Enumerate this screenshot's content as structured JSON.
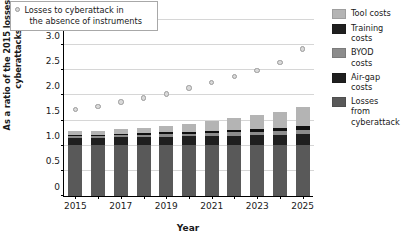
{
  "chart_data": {
    "type": "bar",
    "title": "",
    "xlabel": "Year",
    "ylabel": "As a ratio of the 2015 losses to cyberattacks",
    "ylim": [
      0,
      3.5
    ],
    "ytick_values": [
      0,
      0.5,
      1.0,
      1.5,
      2.0,
      2.5,
      3.0,
      3.5
    ],
    "ytick_labels": [
      "0",
      "0.5",
      "1.0",
      "1.5",
      "2.0",
      "2.5",
      "3.0",
      "3.5"
    ],
    "grid": true,
    "legend_position": "right",
    "categories": [
      "2015",
      "2016",
      "2017",
      "2018",
      "2019",
      "2020",
      "2021",
      "2022",
      "2023",
      "2024",
      "2025"
    ],
    "xtick_labels": [
      "2015",
      "",
      "2017",
      "",
      "2019",
      "",
      "2021",
      "",
      "2023",
      "",
      "2025"
    ],
    "stacked": true,
    "series": [
      {
        "name": "Losses from cyberattack",
        "color": "#595959",
        "values": [
          1.02,
          1.02,
          1.02,
          1.02,
          1.02,
          1.02,
          1.02,
          1.02,
          1.02,
          1.02,
          1.02
        ]
      },
      {
        "name": "Air-gap costs",
        "color": "#1f1f1f",
        "values": [
          0.14,
          0.14,
          0.15,
          0.15,
          0.16,
          0.17,
          0.17,
          0.18,
          0.19,
          0.2,
          0.21
        ]
      },
      {
        "name": "BYOD costs",
        "color": "#8c8c8c",
        "values": [
          0.03,
          0.03,
          0.04,
          0.04,
          0.05,
          0.05,
          0.06,
          0.07,
          0.07,
          0.08,
          0.09
        ]
      },
      {
        "name": "Training costs",
        "color": "#111111",
        "values": [
          0.03,
          0.03,
          0.03,
          0.04,
          0.04,
          0.04,
          0.05,
          0.05,
          0.06,
          0.06,
          0.07
        ]
      },
      {
        "name": "Tool costs",
        "color": "#b4b4b4",
        "values": [
          0.07,
          0.08,
          0.09,
          0.11,
          0.13,
          0.16,
          0.19,
          0.23,
          0.27,
          0.32,
          0.38
        ]
      }
    ],
    "overlay_series": {
      "name": "Losses to cyberattack in the absence of instruments",
      "type": "scatter",
      "marker": "circle",
      "color": "#d9d9d9",
      "values": [
        1.72,
        1.78,
        1.87,
        1.95,
        2.03,
        2.15,
        2.26,
        2.38,
        2.5,
        2.65,
        2.92
      ]
    }
  },
  "inline_legend": {
    "line1": "Losses to cyberattack in",
    "line2": "the absence of instruments"
  },
  "legend": {
    "items": [
      {
        "label1": "Tool costs",
        "label2": "",
        "color": "#b4b4b4"
      },
      {
        "label1": "Training",
        "label2": "costs",
        "color": "#1f1f1f"
      },
      {
        "label1": "BYOD",
        "label2": "costs",
        "color": "#8c8c8c"
      },
      {
        "label1": "Air-gap",
        "label2": "costs",
        "color": "#1f1f1f"
      },
      {
        "label1": "Losses",
        "label2": "from",
        "label3": "cyberattack",
        "color": "#595959"
      }
    ]
  }
}
